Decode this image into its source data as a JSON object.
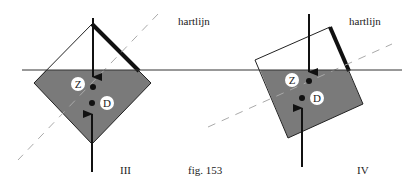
{
  "figure": {
    "caption": "fig. 153",
    "colors": {
      "water": "#7a7a7a",
      "line": "#222222",
      "dash": "#aaaaaa",
      "background": "#ffffff",
      "label_circle": "#ffffff"
    }
  },
  "panels": [
    {
      "id": "III",
      "roman_label": "III",
      "axis_label": "hartlijn",
      "point_labels": {
        "center_of_gravity": "Z",
        "center_of_buoyancy": "D"
      }
    },
    {
      "id": "IV",
      "roman_label": "IV",
      "axis_label": "hartlijn",
      "point_labels": {
        "center_of_gravity": "Z",
        "center_of_buoyancy": "D"
      }
    }
  ]
}
